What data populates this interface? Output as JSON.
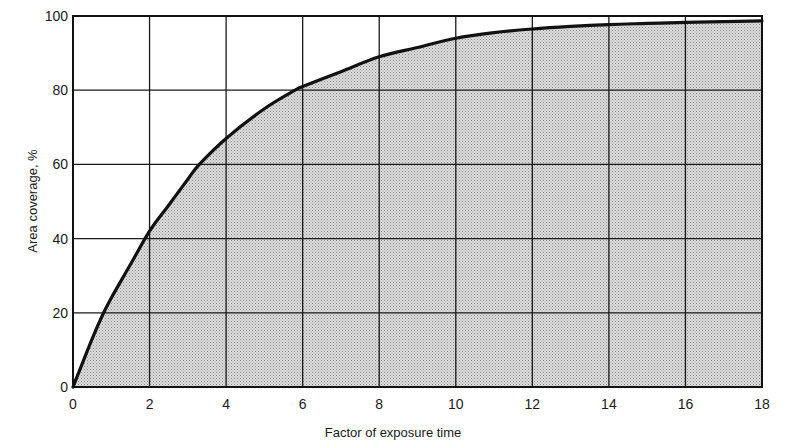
{
  "chart_data": {
    "type": "area",
    "title": "",
    "xlabel": "Factor of exposure time",
    "ylabel": "Area coverage, %",
    "xlim": [
      0,
      18
    ],
    "ylim": [
      0,
      100
    ],
    "xticks": [
      0,
      2,
      4,
      6,
      8,
      10,
      12,
      14,
      16,
      18
    ],
    "yticks": [
      0,
      20,
      40,
      60,
      80,
      100
    ],
    "grid": true,
    "legend": null,
    "fill": "stippled gray under curve",
    "series": [
      {
        "name": "Area coverage",
        "x": [
          0,
          0.5,
          0.8,
          1,
          1.5,
          2,
          2.5,
          3,
          3.3,
          4,
          5,
          5.8,
          6,
          7,
          8,
          9,
          10,
          11,
          12,
          13,
          14,
          15,
          16,
          17,
          18
        ],
        "y": [
          0,
          13,
          20,
          24,
          33,
          42,
          49,
          56,
          60,
          67,
          75,
          80,
          81,
          85,
          89,
          91.5,
          94,
          95.5,
          96.5,
          97.2,
          97.7,
          98,
          98.3,
          98.5,
          98.7
        ]
      }
    ]
  },
  "colors": {
    "line": "#111111",
    "grid": "#1a1a1a",
    "fill": "#d4d4d4",
    "stipple": "#8a8a8a",
    "background": "#ffffff"
  }
}
